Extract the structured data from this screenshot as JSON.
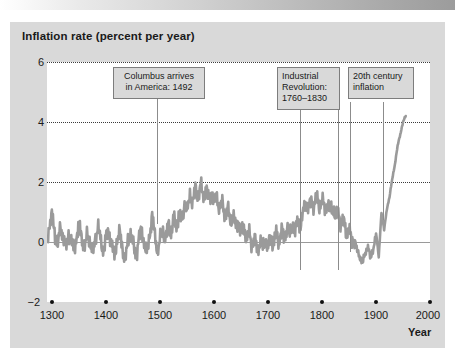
{
  "figure": {
    "title": "Inflation rate (percent per year)",
    "x_axis_label": "Year"
  },
  "colors": {
    "panel_background": "#d9d9d9",
    "plot_background": "#ffffff",
    "series_line": "#9a9a9a",
    "gridline": "#3c3c3c",
    "zero_line": "#9a9a9a",
    "callout_border": "#7d7d7d",
    "text": "#1a1a1a"
  },
  "annotations": [
    {
      "id": "columbus",
      "line1": "Columbus arrives",
      "line2": "in America: 1492",
      "text": "Columbus arrives in America: 1492",
      "year": 1492
    },
    {
      "id": "industrial-revolution",
      "line1": "Industrial",
      "line2": "Revolution:",
      "line3": "1760–1830",
      "text": "Industrial Revolution: 1760–1830",
      "year_start": 1760,
      "year_end": 1830
    },
    {
      "id": "twentieth-century-inflation",
      "line1": "20th century",
      "line2": "inflation",
      "text": "20th century inflation",
      "year": 1930
    }
  ],
  "chart_data": {
    "type": "line",
    "title": "Inflation rate (percent per year)",
    "subtitle": "",
    "xlabel": "Year",
    "ylabel": "Inflation rate (percent per year)",
    "xlim": [
      1290,
      2000
    ],
    "ylim": [
      -2,
      6
    ],
    "xticks": [
      1300,
      1400,
      1500,
      1600,
      1700,
      1800,
      1900,
      2000
    ],
    "xtick_labels": [
      "1300",
      "1400",
      "1500",
      "1600",
      "1700",
      "1800",
      "1900",
      "2000"
    ],
    "yticks": [
      -2,
      0,
      2,
      4,
      6
    ],
    "ytick_labels": [
      "−2",
      "0",
      "2",
      "4",
      "6"
    ],
    "grid": "horizontal-dotted at y = 2, 4, 6",
    "legend": "none",
    "zero_reference_line": 0,
    "series": [
      {
        "name": "Inflation rate",
        "x": [
          1290,
          1295,
          1300,
          1305,
          1310,
          1315,
          1320,
          1325,
          1330,
          1335,
          1340,
          1345,
          1350,
          1355,
          1360,
          1365,
          1370,
          1375,
          1380,
          1385,
          1390,
          1395,
          1400,
          1405,
          1410,
          1415,
          1420,
          1425,
          1430,
          1435,
          1440,
          1445,
          1450,
          1455,
          1460,
          1465,
          1470,
          1475,
          1480,
          1485,
          1490,
          1495,
          1500,
          1505,
          1510,
          1515,
          1520,
          1525,
          1530,
          1535,
          1540,
          1545,
          1550,
          1555,
          1560,
          1565,
          1570,
          1575,
          1580,
          1585,
          1590,
          1595,
          1600,
          1605,
          1610,
          1615,
          1620,
          1625,
          1630,
          1635,
          1640,
          1645,
          1650,
          1655,
          1660,
          1665,
          1670,
          1675,
          1680,
          1685,
          1690,
          1695,
          1700,
          1705,
          1710,
          1715,
          1720,
          1725,
          1730,
          1735,
          1740,
          1745,
          1750,
          1755,
          1760,
          1765,
          1770,
          1775,
          1780,
          1785,
          1790,
          1795,
          1800,
          1805,
          1810,
          1815,
          1820,
          1825,
          1830,
          1835,
          1840,
          1845,
          1850,
          1855,
          1860,
          1865,
          1870,
          1875,
          1880,
          1885,
          1890,
          1895,
          1900,
          1905,
          1910,
          1915,
          1920,
          1925,
          1930,
          1935,
          1940,
          1945,
          1950,
          1955
        ],
        "y": [
          0.1,
          0.6,
          0.9,
          0.2,
          -0.1,
          0.5,
          0.2,
          -0.2,
          0.3,
          0.0,
          -0.3,
          0.2,
          0.6,
          0.1,
          -0.2,
          0.3,
          0.0,
          -0.4,
          0.2,
          0.5,
          0.0,
          -0.3,
          0.2,
          0.4,
          -0.1,
          -0.5,
          0.1,
          0.3,
          -0.2,
          -0.6,
          0.0,
          0.3,
          -0.1,
          -0.5,
          0.1,
          0.4,
          0.0,
          -0.4,
          0.2,
          0.9,
          0.2,
          -0.3,
          0.1,
          0.4,
          0.1,
          0.6,
          0.3,
          0.8,
          0.5,
          1.0,
          0.7,
          1.3,
          1.0,
          1.6,
          1.3,
          1.8,
          1.5,
          1.9,
          1.5,
          1.8,
          1.4,
          1.7,
          1.3,
          1.5,
          1.1,
          1.3,
          0.9,
          1.1,
          0.7,
          0.9,
          0.5,
          0.7,
          0.3,
          0.5,
          0.1,
          0.3,
          -0.1,
          0.1,
          -0.3,
          0.0,
          -0.2,
          0.1,
          -0.2,
          0.2,
          -0.1,
          0.3,
          0.0,
          0.4,
          0.1,
          0.5,
          0.2,
          0.6,
          0.3,
          0.8,
          0.5,
          1.0,
          1.3,
          1.1,
          1.4,
          1.2,
          1.5,
          1.2,
          1.4,
          1.1,
          1.3,
          1.0,
          1.2,
          0.8,
          1.0,
          0.6,
          0.7,
          0.3,
          0.4,
          0.0,
          0.1,
          -0.3,
          -0.5,
          -0.7,
          -0.4,
          -0.1,
          -0.6,
          -0.2,
          0.3,
          -0.5,
          1.0,
          0.4,
          1.1,
          1.5,
          2.1,
          2.6,
          3.2,
          3.6,
          4.0,
          4.2
        ],
        "note": "Annual inflation rate, England/UK long series, ~1290–1955; values estimated from plotted curve"
      }
    ]
  }
}
